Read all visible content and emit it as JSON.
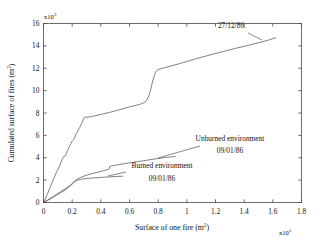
{
  "figure": {
    "background": "#ffffff",
    "line_color": "#555555",
    "axis_color": "#4a4a4a"
  },
  "chart_data": {
    "type": "line",
    "title": "",
    "xlabel": "Surface of one fire (m",
    "xlabel_sup": "2",
    "xlabel_tail": ")",
    "ylabel": "Cumulated surface of fires (m",
    "ylabel_sup": "2",
    "ylabel_tail": ")",
    "x_exponent_label": "x10",
    "x_exponent_sup": "5",
    "y_exponent_label": "x10",
    "y_exponent_sup": "3",
    "xlim": [
      0,
      1.8
    ],
    "ylim": [
      0,
      16
    ],
    "xticks": [
      "0",
      "0.2",
      "0.4",
      "0.6",
      "0.8",
      "1",
      "1.2",
      "1.4",
      "1.6",
      "1.8"
    ],
    "xtick_values": [
      0,
      0.2,
      0.4,
      0.6,
      0.8,
      1.0,
      1.2,
      1.4,
      1.6,
      1.8
    ],
    "yticks": [
      "0",
      "2",
      "4",
      "6",
      "8",
      "10",
      "12",
      "14",
      "16"
    ],
    "ytick_values": [
      0,
      2,
      4,
      6,
      8,
      10,
      12,
      14,
      16
    ],
    "grid": false,
    "legend_position": "in-plot-annotations",
    "series": [
      {
        "name": "27/12/86",
        "x": [
          0.005,
          0.012,
          0.02,
          0.03,
          0.04,
          0.052,
          0.062,
          0.072,
          0.082,
          0.092,
          0.1,
          0.108,
          0.118,
          0.126,
          0.133,
          0.14,
          0.146,
          0.15,
          0.156,
          0.162,
          0.168,
          0.176,
          0.184,
          0.192,
          0.2,
          0.206,
          0.212,
          0.218,
          0.224,
          0.23,
          0.236,
          0.242,
          0.248,
          0.254,
          0.258,
          0.262,
          0.266,
          0.27,
          0.274,
          0.278,
          0.282,
          0.29,
          0.32,
          0.36,
          0.41,
          0.46,
          0.51,
          0.56,
          0.61,
          0.65,
          0.69,
          0.71,
          0.725,
          0.735,
          0.742,
          0.748,
          0.752,
          0.758,
          0.764,
          0.77,
          0.776,
          0.782,
          0.788,
          0.794,
          0.8,
          0.86,
          0.94,
          1.02,
          1.1,
          1.18,
          1.26,
          1.34,
          1.42,
          1.5,
          1.56,
          1.62
        ],
        "y": [
          0.1,
          0.3,
          0.55,
          0.85,
          1.15,
          1.55,
          1.85,
          2.15,
          2.45,
          2.75,
          2.95,
          3.15,
          3.45,
          3.7,
          3.92,
          4.1,
          4.12,
          4.14,
          4.25,
          4.45,
          4.65,
          4.9,
          5.1,
          5.3,
          5.5,
          5.58,
          5.65,
          5.8,
          6.05,
          6.2,
          6.3,
          6.45,
          6.6,
          6.72,
          6.85,
          6.95,
          7.05,
          7.15,
          7.3,
          7.45,
          7.55,
          7.62,
          7.65,
          7.75,
          7.9,
          8.05,
          8.22,
          8.4,
          8.58,
          8.7,
          8.85,
          9.0,
          9.25,
          9.55,
          9.85,
          10.1,
          10.35,
          10.65,
          10.95,
          11.2,
          11.45,
          11.65,
          11.78,
          11.85,
          11.88,
          12.1,
          12.38,
          12.68,
          12.98,
          13.25,
          13.52,
          13.78,
          14.02,
          14.28,
          14.48,
          14.72
        ],
        "endpoint_label": "27/12/86."
      },
      {
        "name": "Unburned environment 09/01/86",
        "x": [
          0.005,
          0.015,
          0.03,
          0.05,
          0.07,
          0.09,
          0.11,
          0.13,
          0.15,
          0.165,
          0.178,
          0.19,
          0.2,
          0.21,
          0.22,
          0.232,
          0.245,
          0.26,
          0.28,
          0.31,
          0.35,
          0.39,
          0.42,
          0.45,
          0.458,
          0.462,
          0.47,
          0.5,
          0.54,
          0.58,
          0.62,
          0.66,
          0.7,
          0.75,
          0.8,
          0.85,
          0.89,
          0.92
        ],
        "y": [
          0.04,
          0.1,
          0.22,
          0.38,
          0.55,
          0.72,
          0.88,
          1.05,
          1.22,
          1.35,
          1.45,
          1.58,
          1.7,
          1.82,
          1.95,
          2.05,
          2.15,
          2.25,
          2.35,
          2.48,
          2.62,
          2.75,
          2.85,
          2.95,
          3.0,
          3.22,
          3.26,
          3.33,
          3.42,
          3.5,
          3.58,
          3.66,
          3.74,
          3.84,
          3.93,
          4.02,
          4.08,
          4.12
        ],
        "label": "Unburned environment",
        "date": "09/01/86"
      },
      {
        "name": "Burned environment 09/01/86",
        "x": [
          0.005,
          0.015,
          0.03,
          0.05,
          0.07,
          0.09,
          0.11,
          0.13,
          0.15,
          0.165,
          0.18,
          0.192,
          0.202,
          0.212,
          0.222,
          0.232,
          0.244,
          0.256,
          0.27,
          0.29,
          0.315,
          0.345,
          0.38,
          0.42,
          0.46,
          0.5,
          0.53,
          0.552
        ],
        "y": [
          0.04,
          0.1,
          0.2,
          0.34,
          0.5,
          0.65,
          0.8,
          0.96,
          1.12,
          1.25,
          1.42,
          1.55,
          1.66,
          1.78,
          1.88,
          1.96,
          2.02,
          2.06,
          2.1,
          2.13,
          2.16,
          2.19,
          2.22,
          2.26,
          2.29,
          2.32,
          2.34,
          2.35
        ],
        "label": "Burned environment",
        "date": "09/01/86"
      }
    ],
    "annotations": [
      {
        "id": "curve-a-label",
        "text": "27/12/86."
      },
      {
        "id": "unburned-label",
        "text": "Unburned environment"
      },
      {
        "id": "unburned-date",
        "text": "09/01/86"
      },
      {
        "id": "burned-label",
        "text": "Burned environment"
      },
      {
        "id": "burned-date",
        "text": "09/01/86"
      }
    ]
  }
}
